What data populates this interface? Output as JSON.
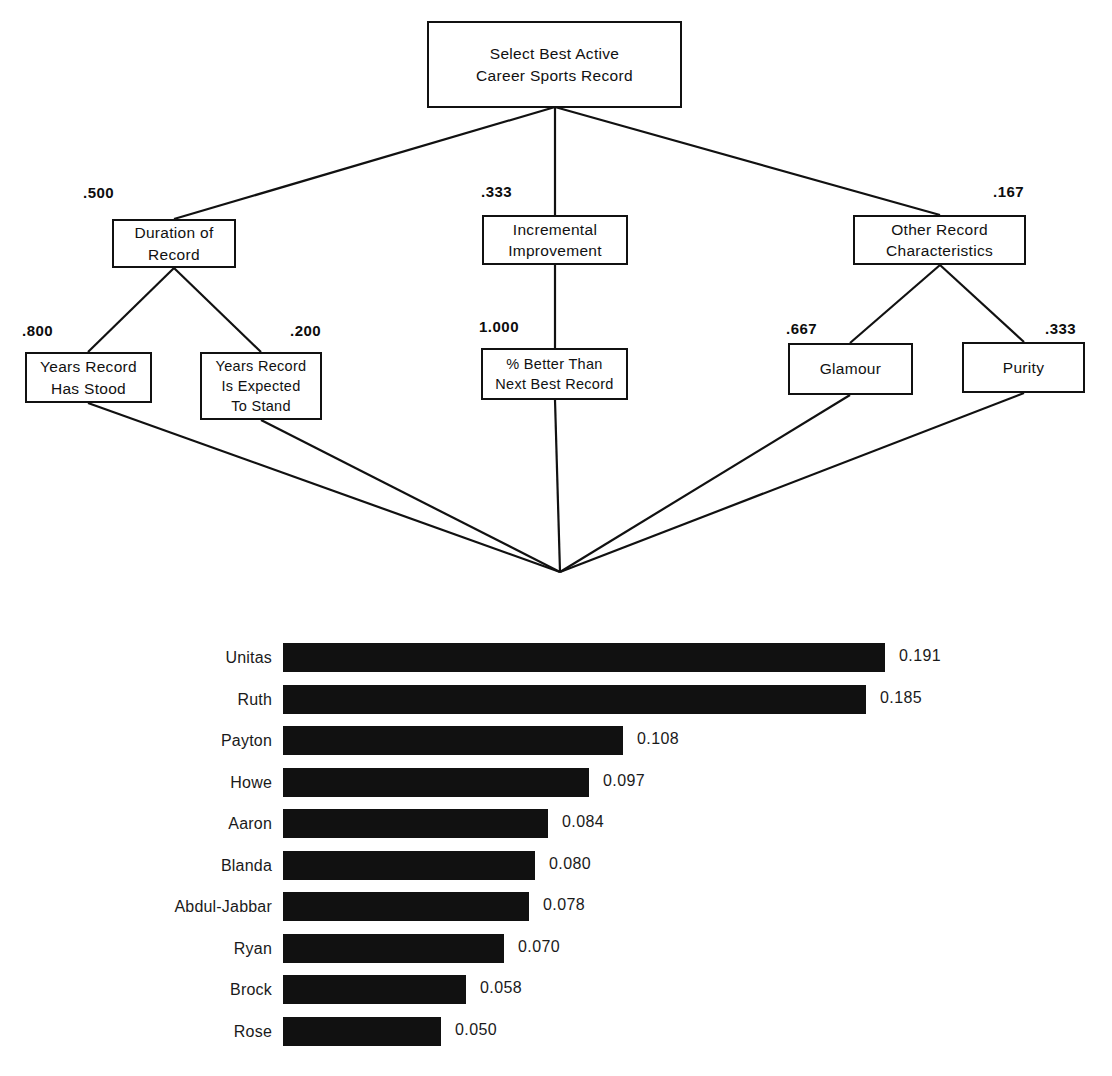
{
  "diagram": {
    "title_node": {
      "id": "goal",
      "label": "Select Best Active\nCareer Sports Record"
    },
    "level2": [
      {
        "id": "duration-of-record",
        "label": "Duration of\nRecord",
        "weight": ".500"
      },
      {
        "id": "incremental-improvement",
        "label": "Incremental\nImprovement",
        "weight": ".333"
      },
      {
        "id": "other-record-characteristics",
        "label": "Other Record\nCharacteristics",
        "weight": ".167"
      }
    ],
    "level3": [
      {
        "id": "years-record-has-stood",
        "label": "Years Record\nHas Stood",
        "weight": ".800"
      },
      {
        "id": "years-record-is-expected-to-stand",
        "label": "Years Record\nIs Expected\nTo Stand",
        "weight": ".200"
      },
      {
        "id": "percent-better-than-next-best-record",
        "label": "% Better Than\nNext Best Record",
        "weight": "1.000"
      },
      {
        "id": "glamour",
        "label": "Glamour",
        "weight": ".667"
      },
      {
        "id": "purity",
        "label": "Purity",
        "weight": ".333"
      }
    ]
  },
  "chart_data": {
    "type": "bar",
    "orientation": "horizontal",
    "title": "",
    "xlabel": "",
    "ylabel": "",
    "grid": false,
    "legend": "none",
    "xlim": [
      0,
      0.2
    ],
    "categories": [
      "Unitas",
      "Ruth",
      "Payton",
      "Howe",
      "Aaron",
      "Blanda",
      "Abdul-Jabbar",
      "Ryan",
      "Brock",
      "Rose"
    ],
    "values": [
      0.191,
      0.185,
      0.108,
      0.097,
      0.084,
      0.08,
      0.078,
      0.07,
      0.058,
      0.05
    ],
    "value_labels": [
      "0.191",
      "0.185",
      "0.108",
      "0.097",
      "0.084",
      "0.080",
      "0.078",
      "0.070",
      "0.058",
      "0.050"
    ],
    "bar_color": "#111111"
  }
}
